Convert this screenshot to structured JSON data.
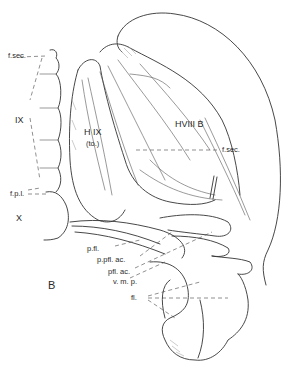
{
  "figure": {
    "panel_label": "B",
    "labels": {
      "f_sec_left": "f.sec.",
      "ix": "IX",
      "f_p_l": "f.p.l.",
      "x": "X",
      "h_ix": "H IX",
      "h_ix_sub": "(to.)",
      "hviii_b": "HVIII B",
      "f_sec_right": "f.sec.",
      "p_fl": "p.fl.",
      "p_pfl_ac": "p.pfl. ac.",
      "pfl_ac": "pfl. ac.",
      "v_m_p": "v. m. p.",
      "fl": "fl."
    },
    "colors": {
      "ink": "#333333",
      "background": "#ffffff"
    }
  }
}
